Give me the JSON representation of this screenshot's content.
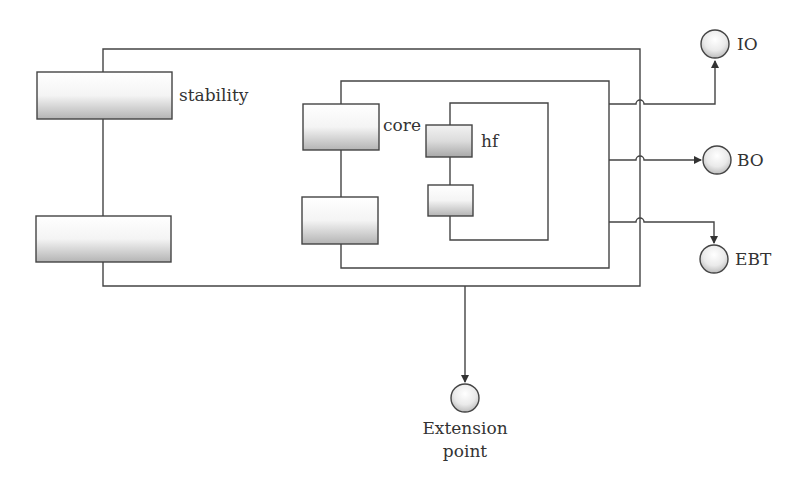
{
  "diagram": {
    "components": {
      "stability": {
        "label": "stability"
      },
      "core": {
        "label": "core"
      },
      "hf": {
        "label": "hf"
      }
    },
    "ports": {
      "io": {
        "label": "IO"
      },
      "bo": {
        "label": "BO"
      },
      "ebt": {
        "label": "EBT"
      },
      "extension": {
        "label_line1": "Extension",
        "label_line2": "point"
      }
    },
    "colors": {
      "stroke": "#444444",
      "text": "#333333",
      "fill_light": "#ffffff",
      "fill_dark": "#b0b0b0"
    }
  }
}
